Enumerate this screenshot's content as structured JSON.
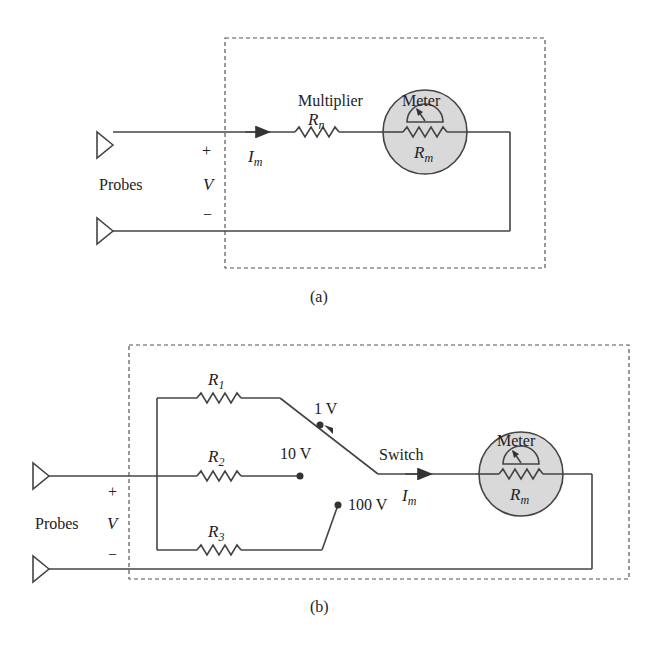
{
  "figure_a": {
    "caption": "(a)",
    "probes_label": "Probes",
    "plus": "+",
    "minus": "−",
    "voltage": "V",
    "current": "I",
    "current_sub": "m",
    "multiplier_label": "Multiplier",
    "multiplier_res": "R",
    "multiplier_res_sub": "n",
    "meter_label": "Meter",
    "meter_res": "R",
    "meter_res_sub": "m"
  },
  "figure_b": {
    "caption": "(b)",
    "probes_label": "Probes",
    "plus": "+",
    "minus": "−",
    "voltage": "V",
    "current": "I",
    "current_sub": "m",
    "switch_label": "Switch",
    "meter_label": "Meter",
    "meter_res": "R",
    "meter_res_sub": "m",
    "resistors": [
      {
        "name": "R",
        "sub": "1",
        "range": "1 V"
      },
      {
        "name": "R",
        "sub": "2",
        "range": "10 V"
      },
      {
        "name": "R",
        "sub": "3",
        "range": "100 V"
      }
    ]
  },
  "colors": {
    "wire": "#444444",
    "meter_fill": "#d9d9d9",
    "box_dash": "#555555"
  }
}
